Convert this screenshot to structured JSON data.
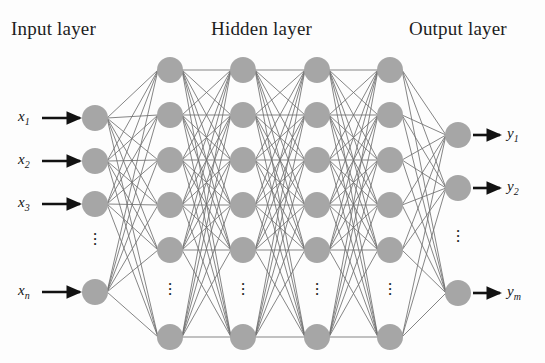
{
  "diagram": {
    "type": "neural-network-architecture",
    "background_color": "#fdfdfd",
    "node_fill": "#a6a6a6",
    "node_radius": 13,
    "edge_color": "#6f6f6f",
    "arrow_color": "#121212",
    "titles": {
      "input": "Input layer",
      "hidden": "Hidden layer",
      "output": "Output layer"
    },
    "vertical_dots_glyph": "·",
    "input_labels": [
      "x₁",
      "x₂",
      "x₃",
      "xₙ"
    ],
    "input_labels_plain": [
      {
        "base": "x",
        "sub": "1"
      },
      {
        "base": "x",
        "sub": "2"
      },
      {
        "base": "x",
        "sub": "3"
      },
      {
        "base": "x",
        "sub": "n"
      }
    ],
    "output_labels_plain": [
      {
        "base": "y",
        "sub": "1"
      },
      {
        "base": "y",
        "sub": "2"
      },
      {
        "base": "y",
        "sub": "m"
      }
    ],
    "layers": [
      {
        "name": "input",
        "x": 95,
        "visible_nodes": 4,
        "node_ys": [
          118,
          161,
          204,
          292
        ],
        "dots_y": 243,
        "labels_side": "left"
      },
      {
        "name": "hidden-1",
        "x": 170,
        "visible_nodes": 6,
        "node_ys": [
          70,
          115,
          160,
          205,
          250,
          337
        ],
        "dots_y": 293
      },
      {
        "name": "hidden-2",
        "x": 243,
        "visible_nodes": 6,
        "node_ys": [
          70,
          115,
          160,
          205,
          250,
          337
        ],
        "dots_y": 293
      },
      {
        "name": "hidden-3",
        "x": 317,
        "visible_nodes": 6,
        "node_ys": [
          70,
          115,
          160,
          205,
          250,
          337
        ],
        "dots_y": 293
      },
      {
        "name": "hidden-4",
        "x": 390,
        "visible_nodes": 6,
        "node_ys": [
          70,
          115,
          160,
          205,
          250,
          337
        ],
        "dots_y": 293
      },
      {
        "name": "output",
        "x": 458,
        "visible_nodes": 3,
        "node_ys": [
          135,
          188,
          293
        ],
        "dots_y": 240,
        "labels_side": "right"
      }
    ],
    "input_arrows": [
      {
        "label_x": 18,
        "y": 118,
        "x1": 42,
        "x2": 80
      },
      {
        "label_x": 18,
        "y": 161,
        "x1": 42,
        "x2": 80
      },
      {
        "label_x": 18,
        "y": 204,
        "x1": 42,
        "x2": 80
      },
      {
        "label_x": 18,
        "y": 292,
        "x1": 42,
        "x2": 80
      }
    ],
    "output_arrows": [
      {
        "label_x": 507,
        "y": 135,
        "x1": 473,
        "x2": 500
      },
      {
        "label_x": 507,
        "y": 188,
        "x1": 473,
        "x2": 500
      },
      {
        "label_x": 507,
        "y": 293,
        "x1": 473,
        "x2": 500
      }
    ]
  }
}
